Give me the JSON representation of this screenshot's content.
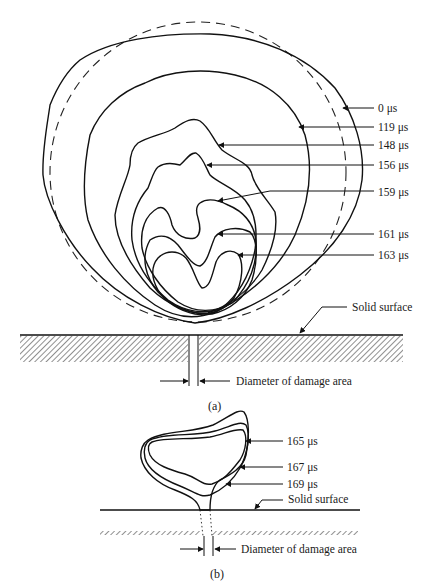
{
  "figure": {
    "part_a": {
      "caption": "(a)",
      "contour_labels": [
        {
          "time": "0 μs",
          "style": "dashed"
        },
        {
          "time": "119 μs",
          "style": "solid"
        },
        {
          "time": "148 μs",
          "style": "solid"
        },
        {
          "time": "156 μs",
          "style": "solid"
        },
        {
          "time": "159 μs",
          "style": "solid"
        },
        {
          "time": "161 μs",
          "style": "solid"
        },
        {
          "time": "163 μs",
          "style": "solid"
        }
      ],
      "surface_label": "Solid surface",
      "damage_label": "Diameter of damage area"
    },
    "part_b": {
      "caption": "(b)",
      "contour_labels": [
        {
          "time": "165 μs"
        },
        {
          "time": "167 μs"
        },
        {
          "time": "169 μs"
        }
      ],
      "surface_label": "Solid surface",
      "damage_label": "Diameter of damage area"
    },
    "colors": {
      "ink": "#111111",
      "background": "#ffffff"
    }
  }
}
